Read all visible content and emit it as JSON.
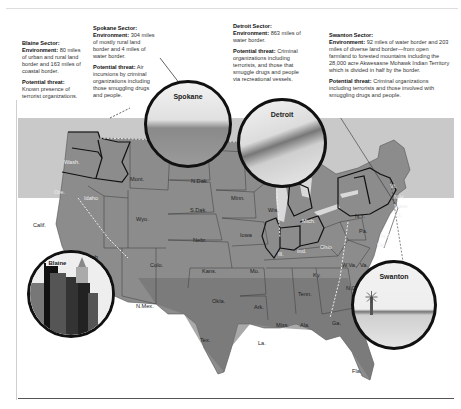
{
  "sectors": [
    {
      "id": "blaine",
      "title": "Blaine Sector:",
      "environment_label": "Environment:",
      "environment": "80 miles of urban and rural land border and 163 miles of coastal border.",
      "threat_label": "Potential threat:",
      "threat": "Known presence of terrorist organizations.",
      "inset_label": "Blaine"
    },
    {
      "id": "spokane",
      "title": "Spokane Sector:",
      "environment_label": "Environment:",
      "environment": "304 miles of mostly rural land border and 4 miles of water border.",
      "threat_label": "Potential threat:",
      "threat": "Air incursions by criminal organizations including those smuggling drugs and people.",
      "inset_label": "Spokane"
    },
    {
      "id": "detroit",
      "title": "Detroit Sector:",
      "environment_label": "Environment:",
      "environment": "863 miles of water border.",
      "threat_label": "Potential threat:",
      "threat": "Criminal organizations including terrorists, and those that smuggle drugs and people via recreational vessels.",
      "inset_label": "Detroit"
    },
    {
      "id": "swanton",
      "title": "Swanton Sector:",
      "environment_label": "Environment:",
      "environment": "92 miles of water border and 203 miles of diverse land border—from open farmland to forested mountains including the 28,000 acre Akwesasne Mohawk Indian Territory which is divided in half by the border.",
      "threat_label": "Potential threat:",
      "threat": "Criminal organizations including terrorists and those involved with smuggling drugs and people.",
      "inset_label": "Swanton"
    }
  ],
  "states": {
    "wash": "Wash.",
    "ore": "Ore.",
    "idaho": "Idaho",
    "mont": "Mont.",
    "wyo": "Wyo.",
    "calif": "Calif.",
    "nev": "Nev.",
    "utah": "Utah",
    "colo": "Colo.",
    "n_mex": "N.Mex.",
    "n_dak": "N.Dak.",
    "s_dak": "S.Dak.",
    "nebr": "Nebr.",
    "kans": "Kans.",
    "okla": "Okla.",
    "tex": "Tex.",
    "minn": "Minn.",
    "iowa": "Iowa",
    "mo": "Mo.",
    "ark": "Ark.",
    "la": "La.",
    "wis": "Wis.",
    "ill": "Ill.",
    "mich": "Mich.",
    "ind": "Ind.",
    "ohio": "Ohio",
    "ky": "Ky.",
    "tenn": "Tenn.",
    "miss": "Miss.",
    "ala": "Ala.",
    "ga": "Ga.",
    "fla": "Fla.",
    "n_y": "N.Y.",
    "pa": "Pa.",
    "w_va": "W.Va.",
    "va": "Va.",
    "n_c": "N.C.",
    "s_c": "S.C.",
    "vt": "Vt.",
    "n_h": "N.H.",
    "mass": "Mass.",
    "ct": "Ct.",
    "n_j": "N.J.",
    "del": "Del.",
    "maine": "Maine"
  },
  "colors": {
    "land": "#8a8a8a",
    "land_dark": "#6e6e6e",
    "canada": "#c8c8c8",
    "border_outline": "#111111",
    "water": "#ffffff",
    "lake": "#d9d9d9"
  }
}
